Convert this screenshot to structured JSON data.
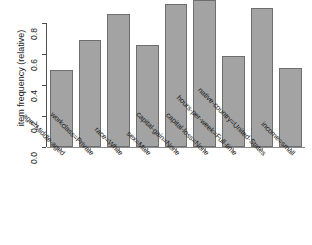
{
  "chart_data": {
    "type": "bar",
    "title": "",
    "subtitle": "",
    "xlabel": "",
    "ylabel": "item frequency (relative)",
    "ylim": [
      0.0,
      0.96
    ],
    "grid": false,
    "legend": "none",
    "yticks": [
      "0.0",
      "0.2",
      "0.4",
      "0.6",
      "0.8"
    ],
    "ytick_values": [
      0.0,
      0.2,
      0.4,
      0.6,
      0.8
    ],
    "categories": [
      "age=Middle-aged",
      "workclass=Private",
      "race=White",
      "sex=Male",
      "capital-gain=None",
      "capital-loss=None",
      "hours-per-week=Full-time",
      "native-country=United-States",
      "income=small"
    ],
    "values": [
      0.5,
      0.69,
      0.86,
      0.66,
      0.92,
      0.95,
      0.59,
      0.9,
      0.51
    ],
    "bar_color": "#a3a3a3",
    "bar_border_color": "#6e6e6e",
    "axis_color": "#4d4d4d",
    "text_color": "#1a1a1a"
  }
}
